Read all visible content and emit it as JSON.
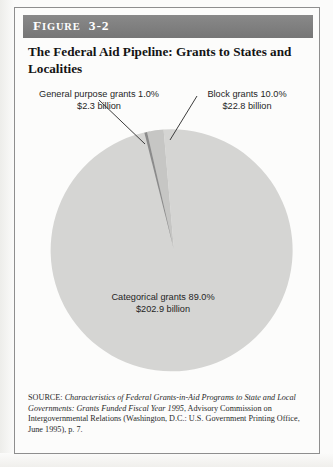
{
  "figure": {
    "label_word": "FIGURE",
    "label_number": "3-2",
    "label_full": "FIGURE 3-2",
    "title": "The Federal Aid Pipeline: Grants to States and Localities"
  },
  "labels": {
    "general": {
      "line1": "General purpose grants 1.0%",
      "line2": "$2.3 billion"
    },
    "block": {
      "line1": "Block grants 10.0%",
      "line2": "$22.8 billion"
    },
    "categorical": {
      "line1": "Categorical grants 89.0%",
      "line2": "$202.9 billion"
    }
  },
  "source": {
    "prefix": "SOURCE: ",
    "title_italic": "Characteristics of Federal Grants-in-Aid Programs to State and Local Governments: Grants Funded Fiscal Year 1995",
    "rest": ", Advisory Commission on Intergovernmental Relations (Washington, D.C.: U.S. Government Printing Office, June 1995), p. 7."
  },
  "colors": {
    "header_band": "#7c7c7c",
    "slice_categorical": "#d5d5d3",
    "slice_block": "#c6c6c4",
    "slice_general": "#8b8b8b",
    "leader_line": "#3c3c3c",
    "box_border": "#8e8e8e"
  },
  "chart_data": {
    "type": "pie",
    "title": "The Federal Aid Pipeline: Grants to States and Localities",
    "categories": [
      "Categorical grants",
      "Block grants",
      "General purpose grants"
    ],
    "values": [
      89.0,
      10.0,
      1.0
    ],
    "value_unit": "percent",
    "amounts": [
      202.9,
      22.8,
      2.3
    ],
    "amount_unit": "billion US dollars",
    "amount_labels": [
      "$202.9 billion",
      "$22.8 billion",
      "$2.3 billion"
    ],
    "percent_labels": [
      "89.0%",
      "10.0%",
      "1.0%"
    ],
    "colors": [
      "#d5d5d3",
      "#c6c6c4",
      "#8b8b8b"
    ],
    "legend": "none",
    "data_labels": [
      "Categorical grants 89.0% $202.9 billion",
      "Block grants 10.0% $22.8 billion",
      "General purpose grants 1.0% $2.3 billion"
    ],
    "start_angle_deg": -4.0,
    "direction": "clockwise",
    "total_percent": 100.0,
    "total_amount": 228.0
  }
}
